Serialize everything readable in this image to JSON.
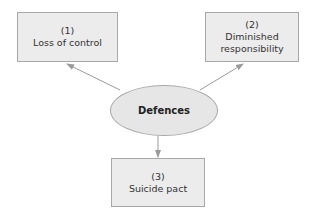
{
  "diagram": {
    "center": {
      "label": "Defences"
    },
    "nodes": [
      {
        "number": "(1)",
        "label": "Loss of control"
      },
      {
        "number": "(2)",
        "label": "Diminished responsibility"
      },
      {
        "number": "(3)",
        "label": "Suicide pact"
      }
    ],
    "colors": {
      "box_fill": "#ececec",
      "border": "#a8a8a8",
      "arrow": "#9a9a9a"
    }
  }
}
